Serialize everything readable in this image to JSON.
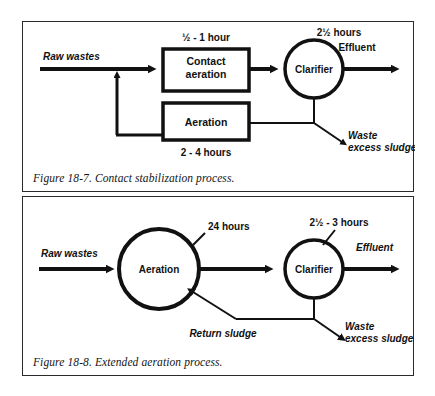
{
  "figures": [
    {
      "id": "figure-18-7",
      "caption": "Figure 18-7.  Contact stabilization process.",
      "nodes": {
        "contact_aeration_line1": "Contact",
        "contact_aeration_line2": "aeration",
        "aeration": "Aeration",
        "clarifier": "Clarifier"
      },
      "labels": {
        "raw_wastes": "Raw wastes",
        "contact_time": "½ - 1 hour",
        "aeration_time": "2 - 4 hours",
        "clarifier_time": "2½ hours",
        "effluent": "Effluent",
        "waste_line1": "Waste",
        "waste_line2": "excess sludge"
      }
    },
    {
      "id": "figure-18-8",
      "caption": "Figure 18-8.  Extended aeration process.",
      "nodes": {
        "aeration": "Aeration",
        "clarifier": "Clarifier"
      },
      "labels": {
        "raw_wastes": "Raw wastes",
        "aeration_time": "24 hours",
        "clarifier_time": "2½ - 3 hours",
        "effluent": "Effluent",
        "return_sludge": "Return sludge",
        "waste_line1": "Waste",
        "waste_line2": "excess sludge"
      }
    }
  ],
  "colors": {
    "ink": "#111111",
    "frame": "#2a2a2a",
    "paper": "#ffffff"
  }
}
